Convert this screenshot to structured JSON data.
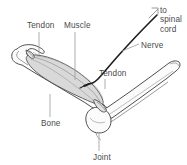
{
  "figure": {
    "kind": "anatomical-line-diagram",
    "background_color": "#ffffff",
    "line_color": "#3c3c3c",
    "muscle_fill_color": "#d9d9d9",
    "bone_fill_color": "#fbfbfb",
    "nerve_color": "#1d1d1d",
    "leader_line_color": "#9a9a9a",
    "label_text_color": "#4a4a4a"
  },
  "labels": {
    "tendon_left": "Tendon",
    "muscle": "Muscle",
    "spinal_cord": "to\nspinal\ncord",
    "nerve": "Nerve",
    "tendon_right": "Tendon",
    "bone": "Bone",
    "joint": "Joint"
  }
}
